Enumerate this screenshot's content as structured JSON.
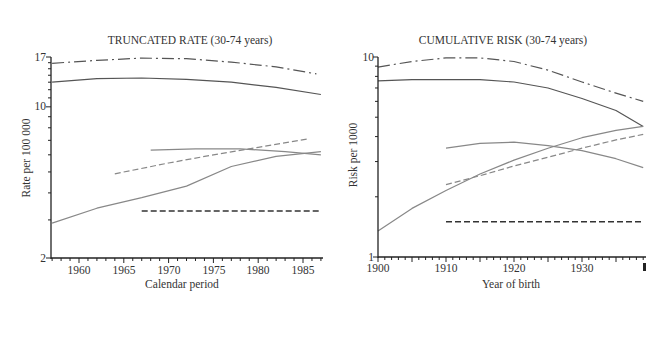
{
  "chart_data": [
    {
      "type": "line",
      "title": "TRUNCATED RATE (30-74 years)",
      "xlabel": "Calendar period",
      "ylabel": "Rate per 100 000",
      "yscale": "log",
      "ylim": [
        2,
        17
      ],
      "xlim": [
        1956.8,
        1987.2
      ],
      "xticks": [
        1960,
        1965,
        1970,
        1975,
        1980,
        1985
      ],
      "yticks": [
        2,
        10,
        17
      ],
      "grid": false,
      "legend": null,
      "series": [
        {
          "name": "dash-dot (top)",
          "style": "dashdot",
          "color": "#555555",
          "x": [
            1957,
            1962,
            1967,
            1972,
            1977,
            1982,
            1986.5
          ],
          "y": [
            15.9,
            16.4,
            16.8,
            16.7,
            16.1,
            15.3,
            14.2
          ]
        },
        {
          "name": "solid (upper)",
          "style": "solid",
          "color": "#555555",
          "x": [
            1957,
            1962,
            1967,
            1972,
            1977,
            1982,
            1987
          ],
          "y": [
            13.0,
            13.5,
            13.6,
            13.4,
            13.0,
            12.3,
            11.4
          ]
        },
        {
          "name": "solid light (flat middle)",
          "style": "solid",
          "color": "#888888",
          "x": [
            1968,
            1973,
            1978,
            1983,
            1987
          ],
          "y": [
            6.3,
            6.4,
            6.4,
            6.2,
            6.0
          ]
        },
        {
          "name": "dashed light (rising)",
          "style": "dashed",
          "color": "#888888",
          "x": [
            1964,
            1970,
            1975,
            1980,
            1985.5
          ],
          "y": [
            4.9,
            5.5,
            6.0,
            6.5,
            7.1
          ]
        },
        {
          "name": "solid light (rising)",
          "style": "solid",
          "color": "#888888",
          "x": [
            1957,
            1962,
            1967,
            1972,
            1977,
            1982,
            1987
          ],
          "y": [
            2.9,
            3.4,
            3.8,
            4.3,
            5.3,
            5.9,
            6.2
          ]
        },
        {
          "name": "dashed dark (flat bottom)",
          "style": "dashed",
          "color": "#333333",
          "x": [
            1967,
            1987
          ],
          "y": [
            3.3,
            3.3
          ]
        }
      ]
    },
    {
      "type": "line",
      "title": "CUMULATIVE RISK (30-74 years)",
      "xlabel": "Year of birth",
      "ylabel": "Risk per 1000",
      "yscale": "log",
      "ylim": [
        1,
        10
      ],
      "xlim": [
        1900,
        1939
      ],
      "xticks": [
        1900,
        1910,
        1920,
        1930
      ],
      "yticks": [
        1,
        10
      ],
      "grid": false,
      "legend": null,
      "series": [
        {
          "name": "dash-dot (top)",
          "style": "dashdot",
          "color": "#555555",
          "x": [
            1900,
            1905,
            1910,
            1915,
            1920,
            1925,
            1930,
            1935,
            1939
          ],
          "y": [
            8.9,
            9.5,
            9.9,
            9.9,
            9.5,
            8.6,
            7.5,
            6.6,
            6.0
          ]
        },
        {
          "name": "solid (upper)",
          "style": "solid",
          "color": "#555555",
          "x": [
            1900,
            1905,
            1910,
            1915,
            1920,
            1925,
            1930,
            1935,
            1939
          ],
          "y": [
            7.6,
            7.7,
            7.7,
            7.7,
            7.5,
            7.0,
            6.2,
            5.4,
            4.5
          ]
        },
        {
          "name": "solid light (arched)",
          "style": "solid",
          "color": "#888888",
          "x": [
            1910,
            1915,
            1920,
            1925,
            1930,
            1935,
            1939
          ],
          "y": [
            3.5,
            3.7,
            3.75,
            3.6,
            3.4,
            3.1,
            2.8
          ]
        },
        {
          "name": "solid light (rising)",
          "style": "solid",
          "color": "#888888",
          "x": [
            1900,
            1905,
            1910,
            1915,
            1920,
            1925,
            1930,
            1935,
            1939
          ],
          "y": [
            1.35,
            1.75,
            2.15,
            2.6,
            3.05,
            3.5,
            3.95,
            4.3,
            4.5
          ]
        },
        {
          "name": "dashed light (rising)",
          "style": "dashed",
          "color": "#888888",
          "x": [
            1910,
            1915,
            1920,
            1925,
            1930,
            1935,
            1939
          ],
          "y": [
            2.3,
            2.55,
            2.85,
            3.15,
            3.5,
            3.85,
            4.1
          ]
        },
        {
          "name": "dashed dark (flat bottom)",
          "style": "dashed",
          "color": "#333333",
          "x": [
            1910,
            1939
          ],
          "y": [
            1.5,
            1.5
          ]
        }
      ]
    }
  ],
  "charts": {
    "left": {
      "title": "TRUNCATED RATE (30-74 years)",
      "xlabel": "Calendar period",
      "ylabel": "Rate per 100 000",
      "y_tick_labels": [
        "17",
        "10",
        "2"
      ],
      "x_tick_labels": [
        "1960",
        "1965",
        "1970",
        "1975",
        "1980",
        "1985"
      ]
    },
    "right": {
      "title": "CUMULATIVE RISK (30-74 years)",
      "xlabel": "Year of birth",
      "ylabel": "Risk per 1000",
      "y_tick_labels": [
        "10",
        "1"
      ],
      "x_tick_labels": [
        "1900",
        "1910",
        "1920",
        "1930"
      ]
    }
  }
}
